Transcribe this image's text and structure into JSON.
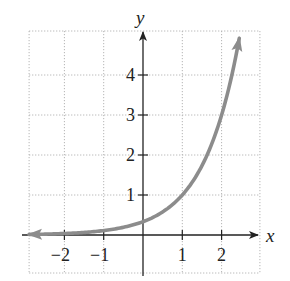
{
  "chart_data": {
    "type": "line",
    "title": "",
    "xlabel": "x",
    "ylabel": "y",
    "function": "y = 3^(x-1)",
    "xlim": [
      -3,
      3
    ],
    "ylim": [
      -1,
      5
    ],
    "grid": true,
    "grid_style": "dotted",
    "x_ticks": [
      -2,
      -1,
      1,
      2
    ],
    "x_tick_labels": [
      "−2",
      "−1",
      "1",
      "2"
    ],
    "y_ticks": [
      1,
      2,
      3,
      4
    ],
    "y_tick_labels": [
      "1",
      "2",
      "3",
      "4"
    ],
    "series": [
      {
        "name": "curve",
        "x": [
          -2.9,
          -2,
          -1,
          0,
          0.5,
          1,
          1.5,
          2,
          2.45
        ],
        "y": [
          0.026,
          0.037,
          0.111,
          0.333,
          0.577,
          1,
          1.732,
          3,
          4.92
        ],
        "color": "#8c8c8c",
        "arrows": "both"
      }
    ],
    "legend": null
  },
  "colors": {
    "curve": "#8c8c8c",
    "axis": "#222222",
    "grid": "#b5b5b5"
  }
}
